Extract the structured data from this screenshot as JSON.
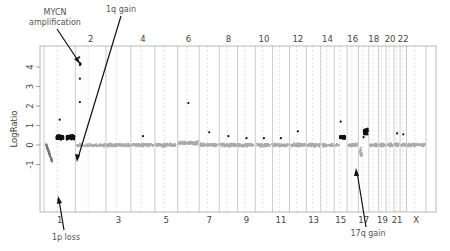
{
  "chart_data": {
    "type": "scatter",
    "title": "",
    "xlabel": "",
    "ylabel": "LogRatio",
    "ylim": [
      -1.2,
      4.8
    ],
    "yticks": [
      -1,
      0,
      1,
      2,
      3,
      4
    ],
    "grid": false,
    "legend": null,
    "chromosomes": [
      "1",
      "2",
      "3",
      "4",
      "5",
      "6",
      "7",
      "8",
      "9",
      "10",
      "11",
      "12",
      "13",
      "14",
      "15",
      "16",
      "17",
      "18",
      "19",
      "20",
      "21",
      "22",
      "X"
    ],
    "top_tick_labels": [
      "2",
      "4",
      "6",
      "8",
      "10",
      "12",
      "14",
      "16",
      "18",
      "20",
      "22"
    ],
    "bottom_tick_labels": [
      "1",
      "3",
      "5",
      "7",
      "9",
      "11",
      "13",
      "15",
      "17",
      "19",
      "21",
      "X"
    ],
    "colors": {
      "normal_points": "#aaaaaa",
      "altered_points": "#111111",
      "chrom_lines": "#bbbbbb",
      "frame": "#999999"
    },
    "segments": [
      {
        "chrom": "1p",
        "log_ratio_range": [
          -0.9,
          0.1
        ],
        "status": "loss"
      },
      {
        "chrom": "1q",
        "log_ratio_mean": 0.4,
        "status": "gain"
      },
      {
        "chrom": "2p (MYCN)",
        "log_ratio_values": [
          4.5,
          4.2,
          4.1,
          4.1,
          3.4,
          2.2
        ],
        "status": "amplification"
      },
      {
        "chrom": "3-14",
        "log_ratio_mean": 0.0,
        "status": "normal"
      },
      {
        "chrom": "15",
        "log_ratio_mean": 0.4,
        "status": "gain"
      },
      {
        "chrom": "16",
        "log_ratio_mean": 0.0,
        "status": "normal"
      },
      {
        "chrom": "17q",
        "log_ratio_mean": 0.7,
        "status": "gain"
      },
      {
        "chrom": "18-X",
        "log_ratio_mean": 0.0,
        "status": "normal"
      }
    ],
    "outliers": [
      {
        "chrom": "1",
        "y": 1.3
      },
      {
        "chrom": "6",
        "y": 2.15
      },
      {
        "chrom": "4",
        "y": 0.45
      },
      {
        "chrom": "7",
        "y": 0.65
      },
      {
        "chrom": "8",
        "y": 0.45
      },
      {
        "chrom": "9",
        "y": 0.35
      },
      {
        "chrom": "10",
        "y": 0.35
      },
      {
        "chrom": "11",
        "y": 0.35
      },
      {
        "chrom": "12",
        "y": 0.7
      },
      {
        "chrom": "15",
        "y": 1.2
      },
      {
        "chrom": "17",
        "y": 0.4
      },
      {
        "chrom": "21",
        "y": 0.6
      },
      {
        "chrom": "22",
        "y": 0.55
      }
    ],
    "annotations": [
      {
        "text": "MYCN amplification",
        "target": "chr2p",
        "y": 4.1
      },
      {
        "text": "1q gain",
        "target": "chr1q",
        "y": 0.5
      },
      {
        "text": "1p loss",
        "target": "chr1p",
        "y": -0.8
      },
      {
        "text": "17q gain",
        "target": "chr17q",
        "y": 0.6
      }
    ]
  },
  "labels": {
    "ylabel": "LogRatio",
    "ann_mycn_1": "MYCN",
    "ann_mycn_2": "amplification",
    "ann_1q": "1q gain",
    "ann_1p": "1p loss",
    "ann_17q": "17q gain"
  }
}
